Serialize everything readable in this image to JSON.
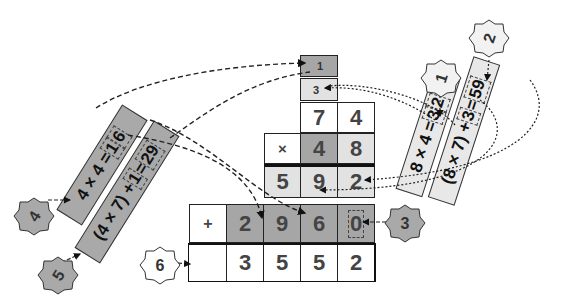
{
  "grid": {
    "carry_top": "1",
    "carry_second": "3",
    "multiplicand": [
      "7",
      "4"
    ],
    "multiplier_row": {
      "operator": "×",
      "digits": [
        "4",
        "8"
      ]
    },
    "partial_1": [
      "5",
      "9",
      "2"
    ],
    "partial_2": {
      "operator": "+",
      "digits": [
        "2",
        "9",
        "6",
        "0"
      ]
    },
    "result": [
      "",
      "3",
      "5",
      "5",
      "2"
    ]
  },
  "steps": [
    {
      "badge": "1",
      "expression_prefix": "8 × 4 = ",
      "carry": "3",
      "digit": "2"
    },
    {
      "badge": "2",
      "expression_prefix": "(8 × 7) + ",
      "carry_in": "3",
      "equals": " = ",
      "value": "59"
    },
    {
      "badge": "3",
      "placeholder": "0"
    },
    {
      "badge": "4",
      "expression_prefix": "4 × 4 = ",
      "carry": "1",
      "digit": "6"
    },
    {
      "badge": "5",
      "expression_prefix": "(4 × 7) + ",
      "carry_in": "1",
      "equals": " = ",
      "value": "29"
    },
    {
      "badge": "6"
    }
  ],
  "colors": {
    "dark_cell": "#a6a6a6",
    "light_cell": "#e2e2e2",
    "border": "#222222"
  }
}
